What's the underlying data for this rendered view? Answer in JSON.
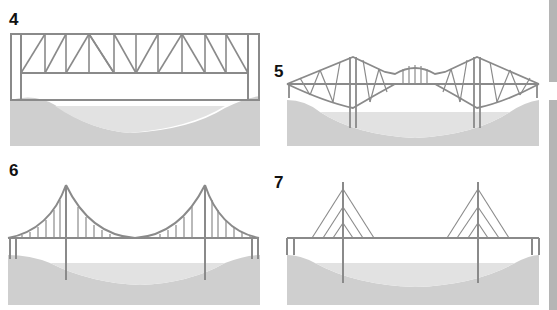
{
  "figure": {
    "panels": [
      {
        "number": "4",
        "type": "truss bridge"
      },
      {
        "number": "5",
        "type": "cantilever bridge"
      },
      {
        "number": "6",
        "type": "suspension bridge"
      },
      {
        "number": "7",
        "type": "cable-stayed bridge"
      }
    ],
    "colors": {
      "structure": "#8a8a8a",
      "ground": "#cfcfcf",
      "water": "#e2e2e2",
      "edge_strip": "#b5b5b5"
    }
  }
}
